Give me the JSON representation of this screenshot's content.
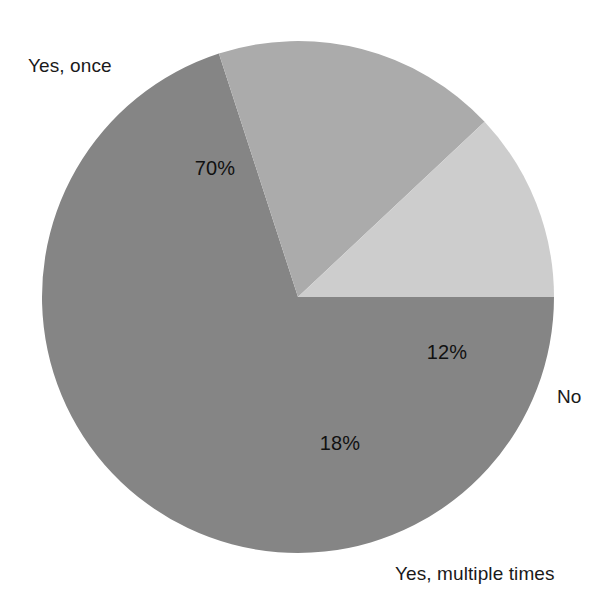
{
  "chart_data": {
    "type": "pie",
    "title": "",
    "categories": [
      "Yes, once",
      "Yes, multiple times",
      "No"
    ],
    "values": [
      70,
      18,
      12
    ],
    "value_labels": [
      "70%",
      "18%",
      "12%"
    ],
    "colors": [
      "#858585",
      "#ababab",
      "#cdcdcd"
    ],
    "legend": "none",
    "labels_position": "outside-callout-free",
    "units": "percent",
    "total": 100,
    "background": "#ffffff",
    "slices": [
      {
        "category": "Yes, once",
        "value": 70,
        "value_label": "70%",
        "color": "#858585",
        "start_angle_deg": 108,
        "end_angle_deg": 360,
        "label_point": {
          "x": 215,
          "y": 168
        },
        "category_label_point": {
          "x": 28,
          "y": 55
        }
      },
      {
        "category": "Yes, multiple times",
        "value": 18,
        "value_label": "18%",
        "color": "#ababab",
        "start_angle_deg": 43.2,
        "end_angle_deg": 108,
        "label_point": {
          "x": 340,
          "y": 443
        },
        "category_label_point": {
          "x": 395,
          "y": 563
        }
      },
      {
        "category": "No",
        "value": 12,
        "value_label": "12%",
        "color": "#cdcdcd",
        "start_angle_deg": 0,
        "end_angle_deg": 43.2,
        "label_point": {
          "x": 447,
          "y": 352
        },
        "category_label_point": {
          "x": 557,
          "y": 386
        }
      }
    ],
    "geometry": {
      "center_x": 298,
      "center_y": 297,
      "radius": 256
    }
  }
}
